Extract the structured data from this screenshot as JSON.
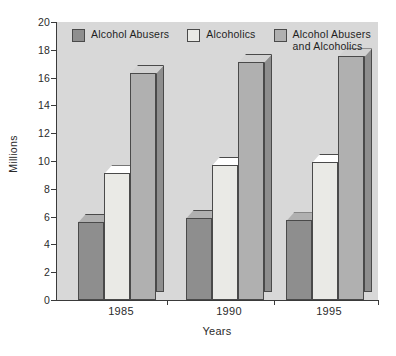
{
  "chart_data": {
    "type": "bar",
    "title": "",
    "subtitle": "",
    "xlabel": "Years",
    "ylabel": "Millions",
    "categories": [
      "1985",
      "1990",
      "1995"
    ],
    "series": [
      {
        "name": "Alcohol Abusers",
        "values": [
          6.2,
          6.5,
          6.3
        ],
        "color": "#8e8e8e"
      },
      {
        "name": "Alcoholics",
        "values": [
          9.7,
          10.3,
          10.5
        ],
        "color": "#eaeae6"
      },
      {
        "name": "Alcohol Abusers and Alcoholics",
        "values": [
          16.9,
          17.7,
          18.1
        ],
        "color": "#b0b0b0"
      }
    ],
    "ylim": [
      0,
      20
    ],
    "ytick_step": 2,
    "yticks": [
      "20",
      "18",
      "16",
      "14",
      "12",
      "10",
      "8",
      "6",
      "4",
      "2",
      "0"
    ],
    "ytick_values": [
      20,
      18,
      16,
      14,
      12,
      10,
      8,
      6,
      4,
      2,
      0
    ],
    "grid": false,
    "legend_position": "top-inside",
    "plot_background": "#d8d8d8",
    "axis_color": "#3a3a3a",
    "bar_outline_color": "#4a4a4a",
    "style": "3d-grouped-bar"
  },
  "legend": {
    "items": [
      {
        "label": "Alcohol Abusers",
        "swatch": "#8e8e8e"
      },
      {
        "label": "Alcoholics",
        "swatch": "#eaeae6"
      },
      {
        "label": "Alcohol Abusers\nand Alcoholics",
        "swatch": "#b0b0b0"
      }
    ]
  }
}
